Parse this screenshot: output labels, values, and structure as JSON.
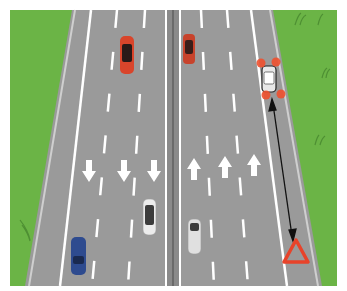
{
  "colors": {
    "background": "#ffffff",
    "grass": "#6bb446",
    "grass_dark": "#4e8f33",
    "road": "#9a9a9a",
    "road_shoulder": "#a4a4a4",
    "markings": "#ffffff",
    "median": "#7d7d7d",
    "car_red": "#d9452b",
    "car_blue": "#2e4b8f",
    "car_white": "#e6e6e6",
    "hazard_light": "#f0502e",
    "triangle": "#e8432a",
    "arrow_line": "#111111"
  },
  "lanes": {
    "left_carriageway_direction": "down",
    "right_carriageway_direction": "up",
    "left_arrows": 3,
    "right_arrows": 3
  },
  "vehicles": [
    {
      "name": "red-car-left-carriageway",
      "color": "red",
      "x": 127,
      "y": 55
    },
    {
      "name": "red-car-right-carriageway",
      "color": "red",
      "x": 189,
      "y": 48
    },
    {
      "name": "broken-down-car-hard-shoulder",
      "color": "white",
      "x": 269,
      "y": 78,
      "hazard_lights": true
    },
    {
      "name": "white-car-left-carriageway",
      "color": "white",
      "x": 149,
      "y": 217
    },
    {
      "name": "blue-car-left-carriageway",
      "color": "blue",
      "x": 78,
      "y": 256
    },
    {
      "name": "white-car-right-carriageway",
      "color": "white",
      "x": 195,
      "y": 236
    }
  ],
  "warning_triangle": {
    "x": 296,
    "y": 252
  },
  "distance_indicator": {
    "from": "broken-down-car",
    "to": "warning-triangle",
    "style": "double-headed arrow"
  }
}
